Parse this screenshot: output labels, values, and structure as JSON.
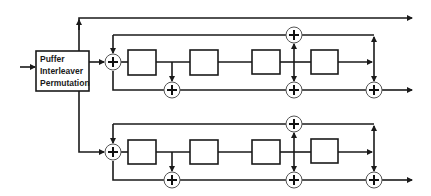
{
  "diagram": {
    "type": "turbo-encoder-block-diagram",
    "interleaver_block": {
      "lines": [
        "Puffer",
        "Interleaver",
        "Permutation"
      ]
    },
    "encoders": [
      {
        "name": "encoder-1",
        "delay_elements": 4,
        "adders": 4
      },
      {
        "name": "encoder-2",
        "delay_elements": 4,
        "adders": 4
      }
    ],
    "adder_symbol": "+",
    "outputs": 3,
    "colors": {
      "line": "#1a1a1a",
      "background": "#ffffff"
    }
  }
}
